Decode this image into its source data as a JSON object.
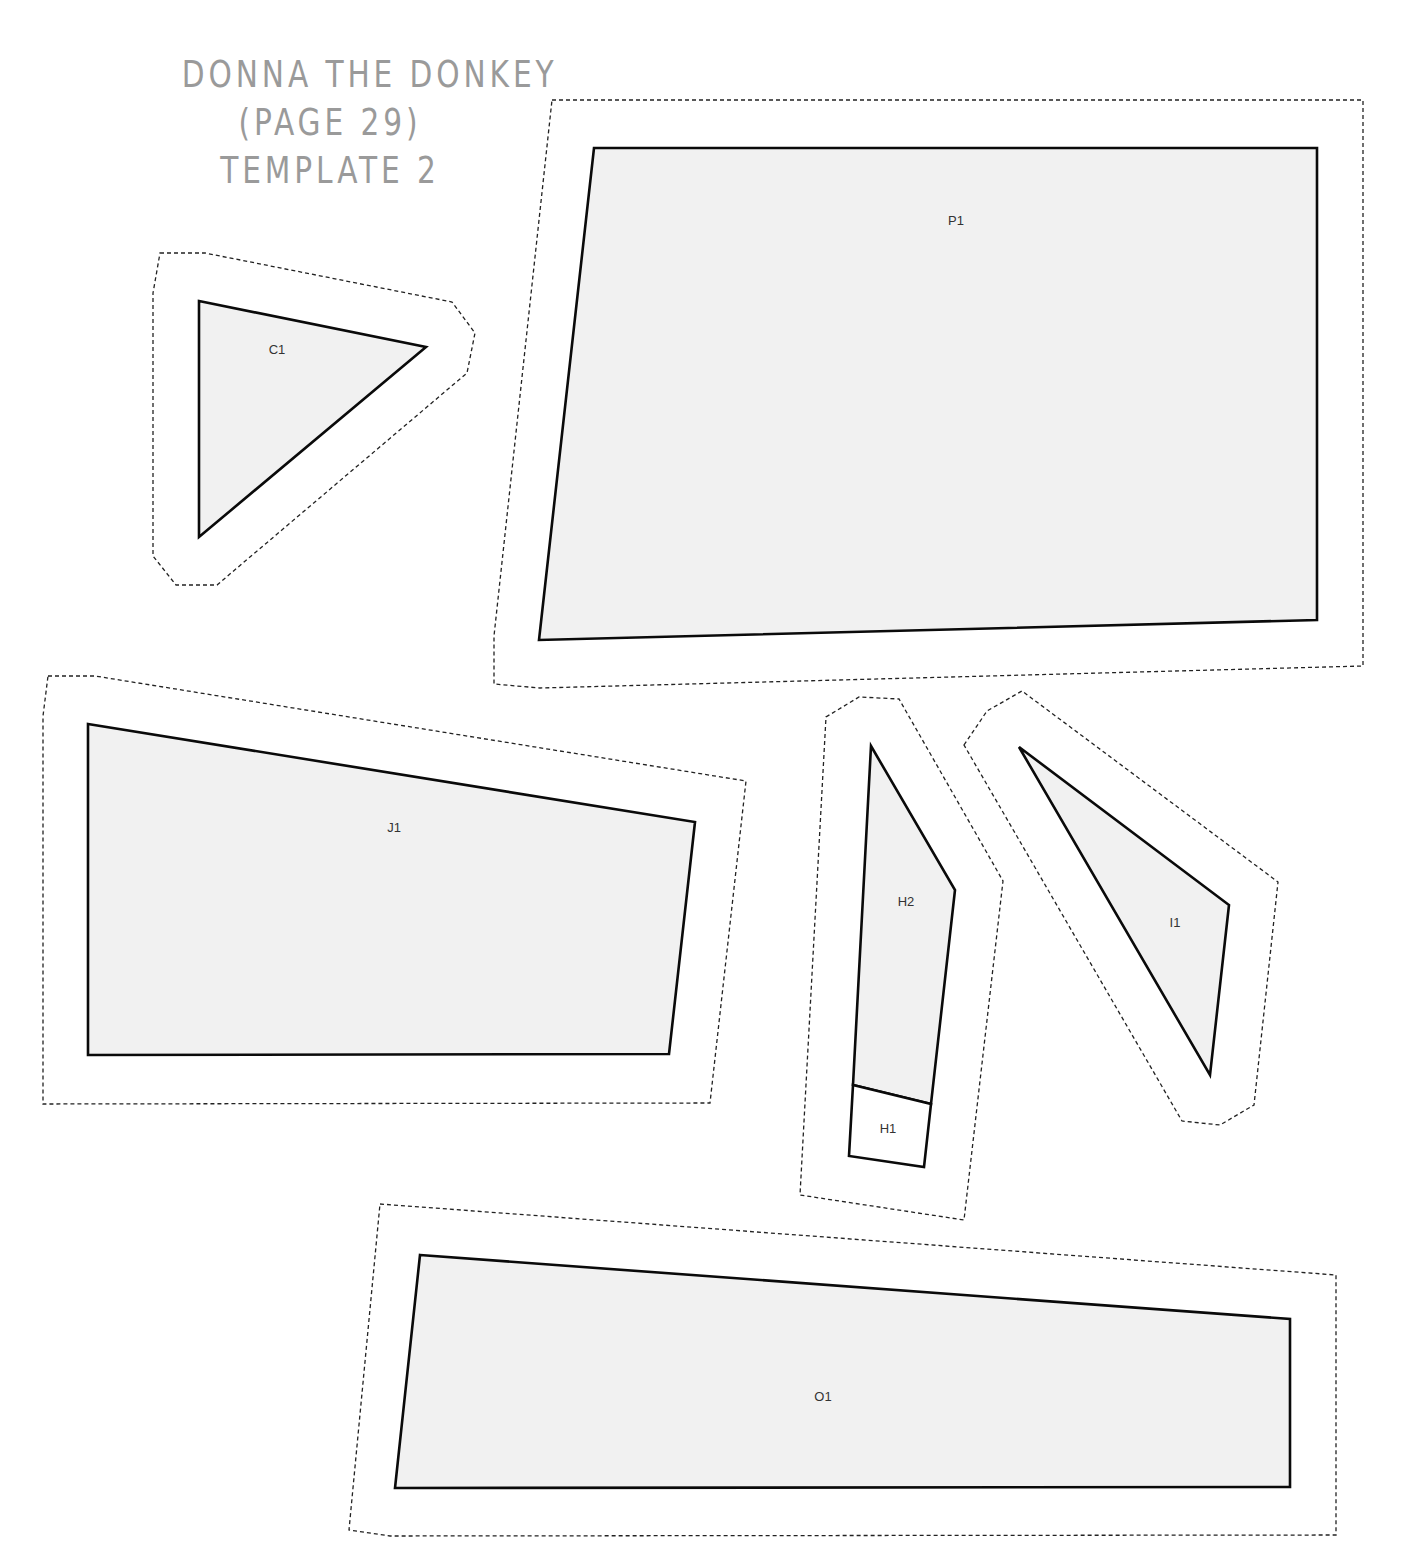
{
  "title": {
    "line1": "DONNA THE DONKEY",
    "line2": "(PAGE 29)",
    "line3": "TEMPLATE 2",
    "color": "#9a9a9a"
  },
  "colors": {
    "piece_fill": "#f1f1f1",
    "piece_stroke": "#0a0a0a",
    "cut_line": "#222222"
  },
  "pieces": [
    {
      "id": "C1",
      "label": "C1"
    },
    {
      "id": "P1",
      "label": "P1"
    },
    {
      "id": "J1",
      "label": "J1"
    },
    {
      "id": "H2",
      "label": "H2"
    },
    {
      "id": "H1",
      "label": "H1"
    },
    {
      "id": "I1",
      "label": "I1"
    },
    {
      "id": "O1",
      "label": "O1"
    }
  ]
}
